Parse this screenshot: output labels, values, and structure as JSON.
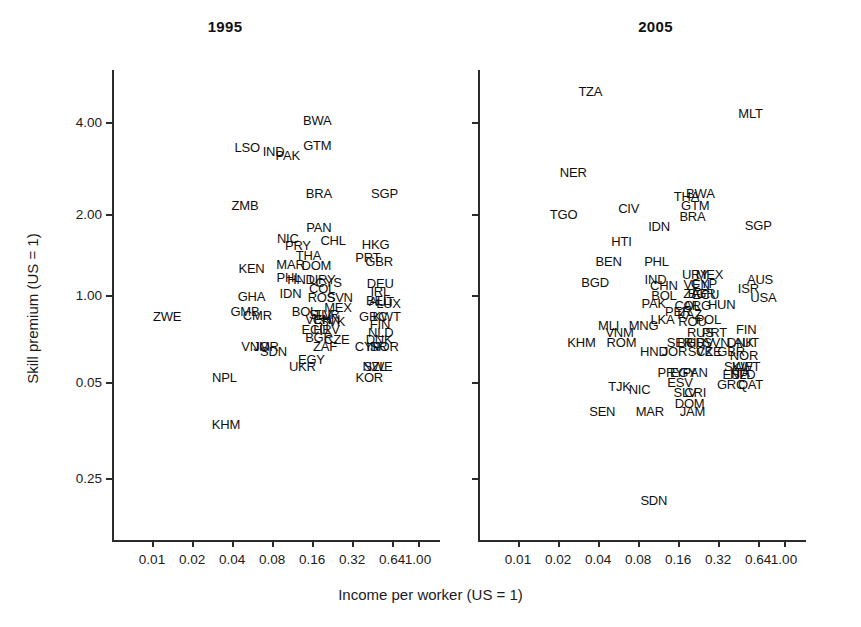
{
  "figure": {
    "ylabel": "Skill premium (US = 1)",
    "xlabel": "Income per worker (US = 1)"
  },
  "chart_data": {
    "type": "scatter",
    "title": "",
    "xlabel": "Income per worker (US = 1)",
    "ylabel": "Skill premium (US = 1)",
    "xscale": "log2",
    "yscale": "log",
    "xticks": [
      "0.01",
      "0.02",
      "0.04",
      "0.08",
      "0.16",
      "0.32",
      "0.64",
      "1.00"
    ],
    "xtick_values": [
      0.01,
      0.02,
      0.04,
      0.08,
      0.16,
      0.32,
      0.64,
      1.0
    ],
    "yticks": [
      "4.00",
      "2.00",
      "1.00",
      "0.05",
      "0.25"
    ],
    "ytick_values": [
      4.0,
      2.0,
      1.0,
      0.5,
      0.25
    ],
    "grid": false,
    "legend": "none",
    "marker_style": "text-label-only",
    "panels": [
      {
        "name": "panel-1995",
        "title": "1995",
        "points": [
          {
            "label": "BWA",
            "x": 0.175,
            "y": 4.05
          },
          {
            "label": "GTM",
            "x": 0.175,
            "y": 3.35
          },
          {
            "label": "LSO",
            "x": 0.052,
            "y": 3.3
          },
          {
            "label": "IND",
            "x": 0.082,
            "y": 3.2
          },
          {
            "label": "PAK",
            "x": 0.105,
            "y": 3.1
          },
          {
            "label": "BRA",
            "x": 0.18,
            "y": 2.3
          },
          {
            "label": "SGP",
            "x": 0.56,
            "y": 2.3
          },
          {
            "label": "ZMB",
            "x": 0.05,
            "y": 2.1
          },
          {
            "label": "PAN",
            "x": 0.18,
            "y": 1.76
          },
          {
            "label": "NIC",
            "x": 0.105,
            "y": 1.62
          },
          {
            "label": "CHL",
            "x": 0.23,
            "y": 1.6
          },
          {
            "label": "HKG",
            "x": 0.48,
            "y": 1.55
          },
          {
            "label": "PRY",
            "x": 0.125,
            "y": 1.53
          },
          {
            "label": "THA",
            "x": 0.15,
            "y": 1.42
          },
          {
            "label": "PRT",
            "x": 0.42,
            "y": 1.4
          },
          {
            "label": "GBR",
            "x": 0.51,
            "y": 1.36
          },
          {
            "label": "MAR",
            "x": 0.11,
            "y": 1.32
          },
          {
            "label": "DOM",
            "x": 0.172,
            "y": 1.31
          },
          {
            "label": "KEN",
            "x": 0.056,
            "y": 1.28
          },
          {
            "label": "PHL",
            "x": 0.107,
            "y": 1.2
          },
          {
            "label": "HND",
            "x": 0.132,
            "y": 1.18
          },
          {
            "label": "URY",
            "x": 0.19,
            "y": 1.18
          },
          {
            "label": "CYS",
            "x": 0.213,
            "y": 1.15
          },
          {
            "label": "DEU",
            "x": 0.52,
            "y": 1.14
          },
          {
            "label": "COL",
            "x": 0.19,
            "y": 1.1
          },
          {
            "label": "IRL",
            "x": 0.52,
            "y": 1.07
          },
          {
            "label": "IDN",
            "x": 0.11,
            "y": 1.06
          },
          {
            "label": "GHA",
            "x": 0.056,
            "y": 1.03
          },
          {
            "label": "ROS",
            "x": 0.188,
            "y": 1.02
          },
          {
            "label": "SVN",
            "x": 0.258,
            "y": 1.02
          },
          {
            "label": "BEL",
            "x": 0.5,
            "y": 1.0
          },
          {
            "label": "AUT",
            "x": 0.53,
            "y": 0.99
          },
          {
            "label": "LUX",
            "x": 0.6,
            "y": 0.98
          },
          {
            "label": "MEX",
            "x": 0.25,
            "y": 0.95
          },
          {
            "label": "GMB",
            "x": 0.05,
            "y": 0.92
          },
          {
            "label": "BOL",
            "x": 0.14,
            "y": 0.92
          },
          {
            "label": "CMR",
            "x": 0.062,
            "y": 0.89
          },
          {
            "label": "SLV",
            "x": 0.185,
            "y": 0.9
          },
          {
            "label": "TUR",
            "x": 0.205,
            "y": 0.9
          },
          {
            "label": "GRC",
            "x": 0.46,
            "y": 0.88
          },
          {
            "label": "KWT",
            "x": 0.58,
            "y": 0.88
          },
          {
            "label": "ZWE",
            "x": 0.013,
            "y": 0.88
          },
          {
            "label": "VEN",
            "x": 0.178,
            "y": 0.86
          },
          {
            "label": "CHN",
            "x": 0.205,
            "y": 0.86
          },
          {
            "label": "SVK",
            "x": 0.228,
            "y": 0.85
          },
          {
            "label": "FIN",
            "x": 0.518,
            "y": 0.83
          },
          {
            "label": "ECU",
            "x": 0.168,
            "y": 0.8
          },
          {
            "label": "HRV",
            "x": 0.205,
            "y": 0.8
          },
          {
            "label": "NLD",
            "x": 0.525,
            "y": 0.78
          },
          {
            "label": "BGR",
            "x": 0.18,
            "y": 0.75
          },
          {
            "label": "CZE",
            "x": 0.245,
            "y": 0.74
          },
          {
            "label": "DNK",
            "x": 0.51,
            "y": 0.74
          },
          {
            "label": "ZAF",
            "x": 0.2,
            "y": 0.7
          },
          {
            "label": "CYP",
            "x": 0.42,
            "y": 0.7
          },
          {
            "label": "ISR",
            "x": 0.49,
            "y": 0.7
          },
          {
            "label": "NOR",
            "x": 0.56,
            "y": 0.7
          },
          {
            "label": "VNM",
            "x": 0.06,
            "y": 0.7
          },
          {
            "label": "JOR",
            "x": 0.072,
            "y": 0.7
          },
          {
            "label": "SDN",
            "x": 0.082,
            "y": 0.67
          },
          {
            "label": "EGY",
            "x": 0.158,
            "y": 0.63
          },
          {
            "label": "UKR",
            "x": 0.135,
            "y": 0.6
          },
          {
            "label": "NZL",
            "x": 0.47,
            "y": 0.6
          },
          {
            "label": "SWE",
            "x": 0.5,
            "y": 0.6
          },
          {
            "label": "KOR",
            "x": 0.43,
            "y": 0.55
          },
          {
            "label": "NPL",
            "x": 0.035,
            "y": 0.55
          },
          {
            "label": "KHM",
            "x": 0.036,
            "y": 0.38
          }
        ]
      },
      {
        "name": "panel-2005",
        "title": "2005",
        "points": [
          {
            "label": "TZA",
            "x": 0.035,
            "y": 5.1
          },
          {
            "label": "MLT",
            "x": 0.56,
            "y": 4.3
          },
          {
            "label": "NER",
            "x": 0.026,
            "y": 2.7
          },
          {
            "label": "THA",
            "x": 0.185,
            "y": 2.25
          },
          {
            "label": "BWA",
            "x": 0.235,
            "y": 2.3
          },
          {
            "label": "GTM",
            "x": 0.215,
            "y": 2.1
          },
          {
            "label": "CIV",
            "x": 0.068,
            "y": 2.05
          },
          {
            "label": "TGO",
            "x": 0.022,
            "y": 1.95
          },
          {
            "label": "BRA",
            "x": 0.205,
            "y": 1.93
          },
          {
            "label": "IDN",
            "x": 0.115,
            "y": 1.78
          },
          {
            "label": "SGP",
            "x": 0.64,
            "y": 1.8
          },
          {
            "label": "HTI",
            "x": 0.06,
            "y": 1.58
          },
          {
            "label": "BEN",
            "x": 0.048,
            "y": 1.35
          },
          {
            "label": "PHL",
            "x": 0.11,
            "y": 1.36
          },
          {
            "label": "URY",
            "x": 0.215,
            "y": 1.22
          },
          {
            "label": "MEX",
            "x": 0.275,
            "y": 1.22
          },
          {
            "label": "BGD",
            "x": 0.038,
            "y": 1.15
          },
          {
            "label": "IND",
            "x": 0.108,
            "y": 1.18
          },
          {
            "label": "CHN",
            "x": 0.125,
            "y": 1.12
          },
          {
            "label": "VEN",
            "x": 0.22,
            "y": 1.13
          },
          {
            "label": "CYP",
            "x": 0.25,
            "y": 1.14
          },
          {
            "label": "AUS",
            "x": 0.66,
            "y": 1.18
          },
          {
            "label": "ISR",
            "x": 0.54,
            "y": 1.1
          },
          {
            "label": "ZAF",
            "x": 0.215,
            "y": 1.06
          },
          {
            "label": "BGR",
            "x": 0.24,
            "y": 1.06
          },
          {
            "label": "ECU",
            "x": 0.258,
            "y": 1.05
          },
          {
            "label": "BOL",
            "x": 0.125,
            "y": 1.04
          },
          {
            "label": "USA",
            "x": 0.7,
            "y": 1.02
          },
          {
            "label": "PAK",
            "x": 0.105,
            "y": 0.98
          },
          {
            "label": "COL",
            "x": 0.188,
            "y": 0.96
          },
          {
            "label": "ARG",
            "x": 0.222,
            "y": 0.96
          },
          {
            "label": "HUN",
            "x": 0.34,
            "y": 0.97
          },
          {
            "label": "PER",
            "x": 0.16,
            "y": 0.92
          },
          {
            "label": "KAZ",
            "x": 0.195,
            "y": 0.9
          },
          {
            "label": "LKA",
            "x": 0.122,
            "y": 0.86
          },
          {
            "label": "ROU",
            "x": 0.205,
            "y": 0.85
          },
          {
            "label": "POL",
            "x": 0.27,
            "y": 0.86
          },
          {
            "label": "MNG",
            "x": 0.088,
            "y": 0.82
          },
          {
            "label": "MLI",
            "x": 0.048,
            "y": 0.82
          },
          {
            "label": "VNM",
            "x": 0.058,
            "y": 0.78
          },
          {
            "label": "RUS",
            "x": 0.235,
            "y": 0.78
          },
          {
            "label": "PRT",
            "x": 0.3,
            "y": 0.78
          },
          {
            "label": "FIN",
            "x": 0.52,
            "y": 0.8
          },
          {
            "label": "KHM",
            "x": 0.03,
            "y": 0.72
          },
          {
            "label": "ROM",
            "x": 0.06,
            "y": 0.72
          },
          {
            "label": "SER",
            "x": 0.165,
            "y": 0.72
          },
          {
            "label": "BGD2",
            "x": 0.2,
            "y": 0.72
          },
          {
            "label": "HRV",
            "x": 0.235,
            "y": 0.72
          },
          {
            "label": "SVN",
            "x": 0.31,
            "y": 0.72
          },
          {
            "label": "DNK",
            "x": 0.47,
            "y": 0.72
          },
          {
            "label": "AUT",
            "x": 0.52,
            "y": 0.72
          },
          {
            "label": "HND",
            "x": 0.105,
            "y": 0.67
          },
          {
            "label": "JOR",
            "x": 0.15,
            "y": 0.67
          },
          {
            "label": "SVK",
            "x": 0.235,
            "y": 0.67
          },
          {
            "label": "CZE",
            "x": 0.272,
            "y": 0.67
          },
          {
            "label": "GBR",
            "x": 0.4,
            "y": 0.67
          },
          {
            "label": "NOR",
            "x": 0.5,
            "y": 0.65
          },
          {
            "label": "SWE",
            "x": 0.455,
            "y": 0.6
          },
          {
            "label": "KWT",
            "x": 0.52,
            "y": 0.6
          },
          {
            "label": "ESP",
            "x": 0.43,
            "y": 0.56
          },
          {
            "label": "ITA",
            "x": 0.47,
            "y": 0.57
          },
          {
            "label": "NLD",
            "x": 0.49,
            "y": 0.56
          },
          {
            "label": "PRY",
            "x": 0.14,
            "y": 0.57
          },
          {
            "label": "EGY",
            "x": 0.175,
            "y": 0.57
          },
          {
            "label": "PAN",
            "x": 0.215,
            "y": 0.57
          },
          {
            "label": "ESV",
            "x": 0.165,
            "y": 0.53
          },
          {
            "label": "GRC",
            "x": 0.4,
            "y": 0.52
          },
          {
            "label": "QAT",
            "x": 0.56,
            "y": 0.52
          },
          {
            "label": "TJK",
            "x": 0.058,
            "y": 0.51
          },
          {
            "label": "NIC",
            "x": 0.082,
            "y": 0.5
          },
          {
            "label": "SLV",
            "x": 0.18,
            "y": 0.49
          },
          {
            "label": "CRI",
            "x": 0.215,
            "y": 0.49
          },
          {
            "label": "DOM",
            "x": 0.195,
            "y": 0.45
          },
          {
            "label": "JAM",
            "x": 0.205,
            "y": 0.42
          },
          {
            "label": "SEN",
            "x": 0.043,
            "y": 0.42
          },
          {
            "label": "MAR",
            "x": 0.098,
            "y": 0.42
          },
          {
            "label": "SDN",
            "x": 0.105,
            "y": 0.21
          }
        ]
      }
    ]
  }
}
